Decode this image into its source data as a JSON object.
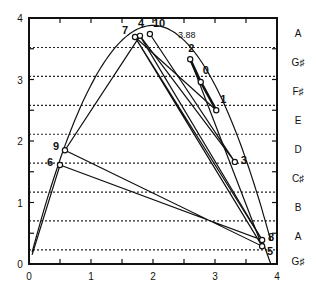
{
  "chart_data": {
    "type": "line",
    "title": "",
    "xlabel": "",
    "ylabel": "",
    "xlim": [
      0,
      4
    ],
    "ylim": [
      0,
      4
    ],
    "x_ticks": [
      0,
      1,
      2,
      3,
      4
    ],
    "y_ticks": [
      0,
      1,
      2,
      3,
      4
    ],
    "x_minor_step": 0.5,
    "y_minor_step": 0.5,
    "grid": "horizontal dotted pitch lines",
    "parabola": {
      "peak_label": "3.88",
      "peak_x": 2,
      "peak_y": 3.88,
      "x_start": 0.05,
      "x_end": 3.9
    },
    "pitch_lines_y": [
      0.23,
      0.7,
      1.17,
      1.64,
      2.11,
      2.58,
      3.05,
      3.52
    ],
    "note_labels": [
      {
        "label": "A",
        "y": 3.76
      },
      {
        "label": "G♯",
        "y": 3.29
      },
      {
        "label": "F♯",
        "y": 2.82
      },
      {
        "label": "E",
        "y": 2.34
      },
      {
        "label": "D",
        "y": 1.87
      },
      {
        "label": "C♯",
        "y": 1.4
      },
      {
        "label": "B",
        "y": 0.93
      },
      {
        "label": "A",
        "y": 0.46
      },
      {
        "label": "G♯",
        "y": 0.05
      }
    ],
    "points": [
      {
        "label": "0",
        "x": 2.77,
        "y": 2.96
      },
      {
        "label": "1",
        "x": 3.02,
        "y": 2.5
      },
      {
        "label": "2",
        "x": 2.6,
        "y": 3.33
      },
      {
        "label": "3",
        "x": 3.32,
        "y": 1.66
      },
      {
        "label": "4",
        "x": 1.79,
        "y": 3.71
      },
      {
        "label": "5",
        "x": 3.76,
        "y": 0.29
      },
      {
        "label": "6",
        "x": 0.5,
        "y": 1.61
      },
      {
        "label": "7",
        "x": 1.71,
        "y": 3.69
      },
      {
        "label": "8",
        "x": 3.76,
        "y": 0.39
      },
      {
        "label": "9",
        "x": 0.58,
        "y": 1.85
      },
      {
        "label": "10",
        "x": 1.95,
        "y": 3.74
      }
    ],
    "cobweb_path": [
      [
        0.05,
        0.15
      ],
      [
        0.5,
        1.61
      ],
      [
        3.76,
        0.39
      ],
      [
        1.71,
        3.69
      ],
      [
        3.76,
        0.29
      ],
      [
        0.58,
        1.85
      ],
      [
        1.79,
        3.71
      ],
      [
        3.32,
        1.66
      ],
      [
        1.95,
        3.74
      ]
    ],
    "bold_segment": [
      [
        2.6,
        3.33
      ],
      [
        2.77,
        2.96
      ],
      [
        3.02,
        2.5
      ]
    ],
    "extra_segments": [
      [
        [
          2.6,
          3.33
        ],
        [
          3.76,
          0.29
        ]
      ],
      [
        [
          1.79,
          3.71
        ],
        [
          3.76,
          0.39
        ]
      ],
      [
        [
          1.71,
          3.69
        ],
        [
          3.02,
          2.5
        ]
      ],
      [
        [
          3.76,
          0.39
        ],
        [
          3.9,
          0.0
        ]
      ]
    ]
  }
}
